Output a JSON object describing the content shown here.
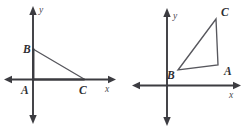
{
  "figure": {
    "background_color": "#ffffff",
    "axis_color": "#3c3c41",
    "triangle_color": "#57575d",
    "label_color": "#2f2f33"
  },
  "panels": [
    {
      "id": "left",
      "name": "preimage-triangle-panel",
      "axis_labels": {
        "x": "x",
        "y": "y"
      },
      "origin": {
        "x": 33,
        "y": 79
      },
      "vertices": [
        {
          "name": "A",
          "label": "A",
          "point": {
            "x": 33,
            "y": 79
          },
          "label_pos": {
            "x": 23,
            "y": 93
          }
        },
        {
          "name": "B",
          "label": "B",
          "point": {
            "x": 33,
            "y": 49
          },
          "label_pos": {
            "x": 22,
            "y": 52
          }
        },
        {
          "name": "C",
          "label": "C",
          "point": {
            "x": 84,
            "y": 79
          },
          "label_pos": {
            "x": 80,
            "y": 93
          }
        }
      ],
      "sides": [
        {
          "from": "A",
          "to": "B",
          "emphasis": "normal"
        },
        {
          "from": "B",
          "to": "C",
          "emphasis": "normal"
        },
        {
          "from": "C",
          "to": "A",
          "emphasis": "heavy"
        }
      ]
    },
    {
      "id": "right",
      "name": "image-triangle-panel",
      "axis_labels": {
        "x": "x",
        "y": "y"
      },
      "origin": {
        "x": 42,
        "y": 85
      },
      "vertices": [
        {
          "name": "A",
          "label": "A",
          "point": {
            "x": 93,
            "y": 65
          },
          "label_pos": {
            "x": 100,
            "y": 73
          }
        },
        {
          "name": "B",
          "label": "B",
          "point": {
            "x": 53,
            "y": 70
          },
          "label_pos": {
            "x": 44,
            "y": 78
          }
        },
        {
          "name": "C",
          "label": "C",
          "point": {
            "x": 91,
            "y": 19
          },
          "label_pos": {
            "x": 97,
            "y": 15
          }
        }
      ],
      "sides": [
        {
          "from": "A",
          "to": "B",
          "emphasis": "normal"
        },
        {
          "from": "B",
          "to": "C",
          "emphasis": "normal"
        },
        {
          "from": "C",
          "to": "A",
          "emphasis": "normal"
        }
      ]
    }
  ]
}
